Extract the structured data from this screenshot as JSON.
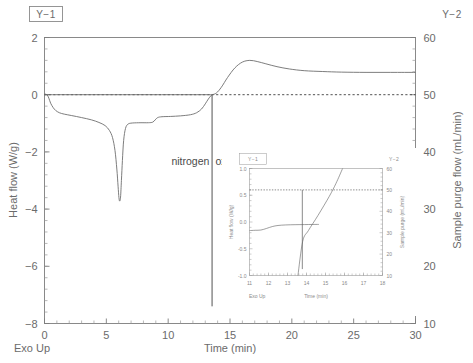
{
  "chart_data": {
    "type": "line",
    "title": "",
    "xlabel": "Time (min)",
    "ylabel": "Heat flow (W/g)",
    "y2label": "Sample purge flow (mL/min)",
    "exo_label": "Exo Up",
    "xlim": [
      0,
      30
    ],
    "ylim": [
      -8,
      2
    ],
    "y2lim": [
      10,
      60
    ],
    "xticks": [
      0,
      5,
      10,
      15,
      20,
      25,
      30
    ],
    "yticks": [
      2,
      0,
      -2,
      -4,
      -6,
      -8
    ],
    "y2ticks": [
      60,
      50,
      40,
      30,
      20,
      10
    ],
    "xtick_labels": [
      "0",
      "5",
      "10",
      "15",
      "20",
      "25",
      "30"
    ],
    "ytick_labels": [
      "2",
      "0",
      "−2",
      "−4",
      "−6",
      "−8"
    ],
    "y2tick_labels": [
      "60",
      "50",
      "40",
      "30",
      "20",
      "10"
    ],
    "grid": false,
    "legend_left": "Y−1",
    "legend_right": "Y−2",
    "annotations": [
      {
        "text": "nitrogen",
        "x": 11.8,
        "y": -2.45
      },
      {
        "text": "oxygen",
        "x": 15.2,
        "y": -2.45
      }
    ],
    "switch_time": 13.55,
    "reference_line_y": 0,
    "series": [
      {
        "name": "Heat flow",
        "axis": "y1",
        "units": "W/g",
        "points": [
          [
            0.0,
            0.02
          ],
          [
            0.2,
            0.0
          ],
          [
            0.35,
            -0.12
          ],
          [
            0.5,
            -0.3
          ],
          [
            0.7,
            -0.45
          ],
          [
            0.9,
            -0.55
          ],
          [
            1.2,
            -0.63
          ],
          [
            1.6,
            -0.68
          ],
          [
            2.2,
            -0.73
          ],
          [
            3.0,
            -0.8
          ],
          [
            3.8,
            -0.88
          ],
          [
            4.4,
            -0.97
          ],
          [
            4.9,
            -1.08
          ],
          [
            5.25,
            -1.25
          ],
          [
            5.5,
            -1.5
          ],
          [
            5.7,
            -1.95
          ],
          [
            5.85,
            -2.6
          ],
          [
            5.95,
            -3.2
          ],
          [
            6.02,
            -3.6
          ],
          [
            6.08,
            -3.72
          ],
          [
            6.15,
            -3.58
          ],
          [
            6.22,
            -3.0
          ],
          [
            6.3,
            -2.3
          ],
          [
            6.4,
            -1.6
          ],
          [
            6.55,
            -1.18
          ],
          [
            6.75,
            -1.03
          ],
          [
            7.1,
            -0.99
          ],
          [
            7.8,
            -0.98
          ],
          [
            8.4,
            -0.98
          ],
          [
            8.75,
            -0.96
          ],
          [
            8.95,
            -0.88
          ],
          [
            9.15,
            -0.8
          ],
          [
            9.5,
            -0.77
          ],
          [
            10.2,
            -0.76
          ],
          [
            11.0,
            -0.74
          ],
          [
            11.8,
            -0.7
          ],
          [
            12.3,
            -0.63
          ],
          [
            12.7,
            -0.5
          ],
          [
            13.0,
            -0.32
          ],
          [
            13.25,
            -0.15
          ],
          [
            13.45,
            -0.04
          ],
          [
            13.55,
            0.0
          ]
        ]
      },
      {
        "name": "Sample purge flow",
        "axis": "y2",
        "units": "mL/min",
        "points": [
          [
            0.0,
            50.0
          ],
          [
            5.0,
            50.0
          ],
          [
            10.0,
            50.0
          ],
          [
            13.2,
            50.0
          ],
          [
            13.55,
            50.0
          ],
          [
            13.9,
            50.3
          ],
          [
            14.3,
            51.3
          ],
          [
            14.8,
            53.0
          ],
          [
            15.4,
            54.7
          ],
          [
            16.0,
            55.7
          ],
          [
            16.6,
            56.0
          ],
          [
            17.2,
            55.8
          ],
          [
            17.9,
            55.4
          ],
          [
            18.8,
            54.9
          ],
          [
            19.8,
            54.5
          ],
          [
            21.0,
            54.2
          ],
          [
            22.5,
            54.05
          ],
          [
            24.0,
            53.95
          ],
          [
            26.0,
            53.9
          ],
          [
            28.0,
            53.9
          ],
          [
            30.0,
            53.9
          ]
        ]
      }
    ]
  },
  "inset": {
    "legend_left": "Y−1",
    "legend_right": "Y−2",
    "xlabel": "Time (min)",
    "ylabel": "Heat flow (W/g)",
    "y2label": "Sample purge (mL/min)",
    "exo_label": "Exo Up",
    "xlim": [
      11,
      18
    ],
    "ylim": [
      -1.0,
      1.0
    ],
    "y2lim": [
      10,
      60
    ],
    "xticks": [
      11,
      12,
      13,
      14,
      15,
      16,
      17,
      18
    ],
    "yticks": [
      1.0,
      0.5,
      0.0,
      -0.5,
      -1.0
    ],
    "y2ticks": [
      60,
      50,
      40,
      30,
      20,
      10
    ],
    "xtick_labels": [
      "11",
      "12",
      "13",
      "14",
      "15",
      "16",
      "17",
      "18"
    ],
    "ytick_labels": [
      "1.0",
      "0.5",
      "0.0",
      "-0.5",
      "-1.0"
    ],
    "y2tick_labels": [
      "60",
      "50",
      "40",
      "30",
      "20",
      "10"
    ],
    "reference_line_y": 0.6,
    "switch_time": 13.78,
    "series": [
      {
        "name": "Heat flow",
        "axis": "y1",
        "points": [
          [
            11.0,
            -0.16
          ],
          [
            11.3,
            -0.155
          ],
          [
            11.6,
            -0.15
          ],
          [
            11.9,
            -0.12
          ],
          [
            12.2,
            -0.085
          ],
          [
            12.5,
            -0.065
          ],
          [
            12.9,
            -0.055
          ],
          [
            13.4,
            -0.05
          ],
          [
            13.9,
            -0.048
          ],
          [
            14.3,
            -0.046
          ],
          [
            14.65,
            -0.045
          ]
        ]
      },
      {
        "name": "Sample purge flow",
        "axis": "y2",
        "points": [
          [
            13.55,
            10.0
          ],
          [
            13.8,
            26.0
          ],
          [
            14.1,
            31.0
          ],
          [
            14.6,
            38.0
          ],
          [
            15.2,
            47.0
          ],
          [
            15.55,
            53.0
          ],
          [
            15.9,
            60.0
          ]
        ]
      }
    ]
  }
}
